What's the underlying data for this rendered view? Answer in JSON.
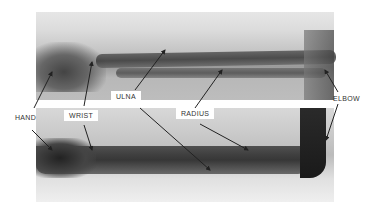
{
  "figure": {
    "labels": {
      "hand": "HAND",
      "wrist": "WRIST",
      "ulna": "ULNA",
      "radius": "RADIUS",
      "elbow": "ELBOW"
    }
  }
}
